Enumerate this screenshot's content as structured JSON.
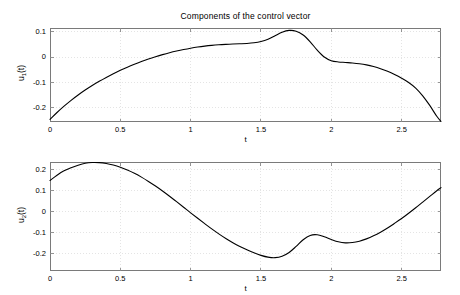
{
  "figure": {
    "title": "Components of the control vector",
    "background": "#ffffff",
    "axis_color": "#7a7a7a",
    "grid_color": "#d8d8d8",
    "line_color": "#000000"
  },
  "chart_data": [
    {
      "type": "line",
      "id": "u1-plot",
      "title": "Components of the control vector",
      "xlabel": "t",
      "ylabel": "u_1(t)",
      "ylabel_base": "u",
      "ylabel_sub": "1",
      "ylabel_suffix": "(t)",
      "xlim": [
        0,
        2.78
      ],
      "ylim": [
        -0.2555,
        0.1155
      ],
      "xticks": [
        0,
        0.5,
        1,
        1.5,
        2,
        2.5
      ],
      "xticklabels": [
        "0",
        "0.5",
        "1",
        "1.5",
        "2",
        "2.5"
      ],
      "yticks": [
        0.1,
        0,
        -0.1,
        -0.2
      ],
      "yticklabels": [
        "0.1",
        "0",
        "-0.1",
        "-0.2"
      ],
      "grid": true,
      "legend": null,
      "series": [
        {
          "name": "u1",
          "x": [
            0.0,
            0.05,
            0.1,
            0.15,
            0.2,
            0.25,
            0.3,
            0.35,
            0.4,
            0.45,
            0.5,
            0.55,
            0.6,
            0.65,
            0.7,
            0.75,
            0.8,
            0.85,
            0.9,
            0.95,
            1.0,
            1.05,
            1.1,
            1.15,
            1.2,
            1.25,
            1.3,
            1.35,
            1.4,
            1.45,
            1.5,
            1.55,
            1.6,
            1.65,
            1.7,
            1.75,
            1.8,
            1.85,
            1.9,
            1.95,
            2.0,
            2.05,
            2.1,
            2.15,
            2.2,
            2.25,
            2.3,
            2.35,
            2.4,
            2.45,
            2.5,
            2.55,
            2.6,
            2.65,
            2.7,
            2.75,
            2.78
          ],
          "y": [
            -0.245,
            -0.218,
            -0.193,
            -0.17,
            -0.149,
            -0.1295,
            -0.1115,
            -0.095,
            -0.0795,
            -0.065,
            -0.0515,
            -0.039,
            -0.0275,
            -0.0168,
            -0.007,
            0.002,
            0.0103,
            0.0178,
            0.0245,
            0.0305,
            0.0358,
            0.0403,
            0.044,
            0.047,
            0.0493,
            0.051,
            0.0523,
            0.0533,
            0.0545,
            0.057,
            0.062,
            0.071,
            0.0845,
            0.0985,
            0.106,
            0.103,
            0.088,
            0.061,
            0.028,
            0.001,
            -0.0135,
            -0.0185,
            -0.0205,
            -0.0225,
            -0.0255,
            -0.03,
            -0.0365,
            -0.045,
            -0.0555,
            -0.068,
            -0.0825,
            -0.0995,
            -0.1215,
            -0.152,
            -0.19,
            -0.233,
            -0.253
          ]
        }
      ]
    },
    {
      "type": "line",
      "id": "u2-plot",
      "title": "",
      "xlabel": "t",
      "ylabel": "u_2(t)",
      "ylabel_base": "u",
      "ylabel_sub": "2",
      "ylabel_suffix": "(t)",
      "xlim": [
        0,
        2.78
      ],
      "ylim": [
        -0.281,
        0.238
      ],
      "xticks": [
        0,
        0.5,
        1,
        1.5,
        2,
        2.5
      ],
      "xticklabels": [
        "0",
        "0.5",
        "1",
        "1.5",
        "2",
        "2.5"
      ],
      "yticks": [
        0.2,
        0.1,
        0,
        -0.1,
        -0.2
      ],
      "yticklabels": [
        "0.2",
        "0.1",
        "0",
        "-0.1",
        "-0.2"
      ],
      "grid": true,
      "legend": null,
      "series": [
        {
          "name": "u2",
          "x": [
            0.0,
            0.05,
            0.1,
            0.15,
            0.2,
            0.25,
            0.3,
            0.35,
            0.4,
            0.45,
            0.5,
            0.55,
            0.6,
            0.65,
            0.7,
            0.75,
            0.8,
            0.85,
            0.9,
            0.95,
            1.0,
            1.05,
            1.1,
            1.15,
            1.2,
            1.25,
            1.3,
            1.35,
            1.4,
            1.45,
            1.5,
            1.55,
            1.6,
            1.65,
            1.7,
            1.75,
            1.8,
            1.85,
            1.9,
            1.95,
            2.0,
            2.05,
            2.1,
            2.15,
            2.2,
            2.25,
            2.3,
            2.35,
            2.4,
            2.45,
            2.5,
            2.55,
            2.6,
            2.65,
            2.7,
            2.75,
            2.78
          ],
          "y": [
            0.15,
            0.175,
            0.196,
            0.211,
            0.223,
            0.232,
            0.2355,
            0.235,
            0.231,
            0.2235,
            0.213,
            0.1995,
            0.184,
            0.166,
            0.1455,
            0.1235,
            0.1,
            0.075,
            0.049,
            0.0225,
            -0.004,
            -0.03,
            -0.0555,
            -0.0805,
            -0.104,
            -0.126,
            -0.146,
            -0.164,
            -0.18,
            -0.1945,
            -0.2065,
            -0.215,
            -0.2175,
            -0.211,
            -0.193,
            -0.164,
            -0.132,
            -0.1115,
            -0.1085,
            -0.118,
            -0.131,
            -0.142,
            -0.147,
            -0.1455,
            -0.139,
            -0.128,
            -0.1135,
            -0.096,
            -0.076,
            -0.054,
            -0.031,
            -0.006,
            0.02,
            0.047,
            0.074,
            0.101,
            0.116
          ]
        }
      ]
    }
  ]
}
